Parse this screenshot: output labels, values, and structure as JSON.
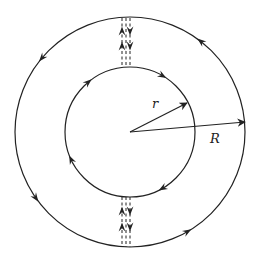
{
  "diagram": {
    "center": {
      "x": 130,
      "y": 132
    },
    "outer_circle": {
      "radius": 115,
      "direction": "counterclockwise",
      "arrow_angles_deg": [
        52,
        140,
        215,
        300
      ]
    },
    "inner_circle": {
      "radius": 65,
      "direction": "clockwise",
      "arrow_angles_deg": [
        60,
        130,
        205,
        300
      ]
    },
    "radius_labels": {
      "inner": "r",
      "outer": "R"
    },
    "inner_radius_tip": {
      "x": 187,
      "y": 103
    },
    "outer_radius_tip": {
      "x": 245,
      "y": 122
    },
    "inner_label_pos": {
      "x": 152,
      "y": 108
    },
    "outer_label_pos": {
      "x": 210,
      "y": 143
    },
    "cuts": [
      {
        "name": "top-cut",
        "y_start": 18,
        "y_end": 67,
        "lines_x": [
          122,
          126,
          130
        ],
        "up_arrows_y": [
          31,
          46
        ],
        "down_arrows_y": [
          31,
          46
        ]
      },
      {
        "name": "bottom-cut",
        "y_start": 197,
        "y_end": 247,
        "lines_x": [
          122,
          126,
          130
        ],
        "up_arrows_y": [
          211,
          227
        ],
        "down_arrows_y": [
          211,
          227
        ]
      }
    ],
    "stroke_color": "#222222",
    "background_color": "#ffffff"
  }
}
